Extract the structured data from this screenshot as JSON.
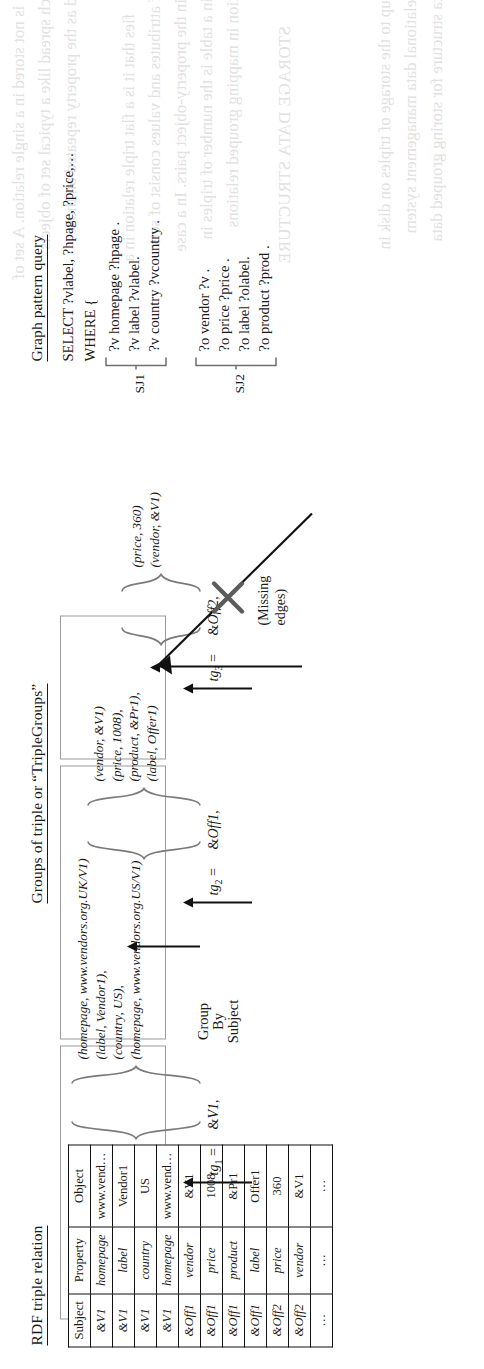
{
  "figure": {
    "orientation": "rotated-90-ccw",
    "sections": {
      "rdf_table_title": "RDF triple relation",
      "triple_groups_title": "Groups of triple or “TripleGroups”",
      "query_title": "Graph pattern query"
    }
  },
  "rdf_table": {
    "columns": [
      "Subject",
      "Property",
      "Object"
    ],
    "rows": [
      {
        "subject": "&V1",
        "property": "homepage",
        "object": "www.vend…",
        "group": 1
      },
      {
        "subject": "&V1",
        "property": "label",
        "object": "Vendor1",
        "group": 1
      },
      {
        "subject": "&V1",
        "property": "country",
        "object": "US",
        "group": 1
      },
      {
        "subject": "&V1",
        "property": "homepage",
        "object": "www.vend…",
        "group": 1
      },
      {
        "subject": "&Off1",
        "property": "vendor",
        "object": "&V1",
        "group": 2
      },
      {
        "subject": "&Off1",
        "property": "price",
        "object": "1008",
        "group": 2
      },
      {
        "subject": "&Off1",
        "property": "product",
        "object": "&Pr1",
        "group": 2
      },
      {
        "subject": "&Off1",
        "property": "label",
        "object": "Offer1",
        "group": 2
      },
      {
        "subject": "&Off2",
        "property": "price",
        "object": "360",
        "group": 3
      },
      {
        "subject": "&Off2",
        "property": "vendor",
        "object": "&V1",
        "group": 3
      },
      {
        "subject": "…",
        "property": "…",
        "object": "…",
        "group": 0
      }
    ]
  },
  "group_by": {
    "line1": "Group",
    "line2": "By",
    "line3": "Subject"
  },
  "triple_groups": [
    {
      "name": "tg",
      "index": "1",
      "equals": "=",
      "key": "&V1,",
      "triples": [
        "(homepage, www.vendors.org.UK/V1)",
        "(label,        Vendor1),",
        "(country,     US),",
        "(homepage, www.vendors.org.US/V1)"
      ]
    },
    {
      "name": "tg",
      "index": "2",
      "equals": "=",
      "key": "&Off1,",
      "triples": [
        "(vendor,   &V1)",
        "(price,     1008),",
        "(product, &Pr1),",
        "(label,      Offer1)"
      ]
    },
    {
      "name": "tg",
      "index": "3",
      "equals": "=",
      "key": "&Off2,",
      "triples": [
        "(price,    360)",
        "(vendor, &V1)"
      ]
    }
  ],
  "query": {
    "select_line": "SELECT ?vlabel, ?hpage, ?price,…",
    "where_line": "WHERE {",
    "sj1": {
      "label": "SJ1",
      "patterns": [
        "?v homepage ?hpage .",
        "?v label ?vlabel.",
        "?v country ?vcountry ."
      ]
    },
    "sj2": {
      "label": "SJ2",
      "patterns": [
        "?o vendor ?v .",
        "?o price ?price .",
        "?o label ?olabel.",
        "?o product ?prod ."
      ]
    }
  },
  "annotations": {
    "missing_edges": "(Missing\nedges)",
    "missing_edges_line1": "(Missing",
    "missing_edges_line2": "edges)"
  },
  "colors": {
    "ink": "#1a1a1a",
    "grey_outline": "#9a9a9a",
    "paper": "#ffffff"
  }
}
